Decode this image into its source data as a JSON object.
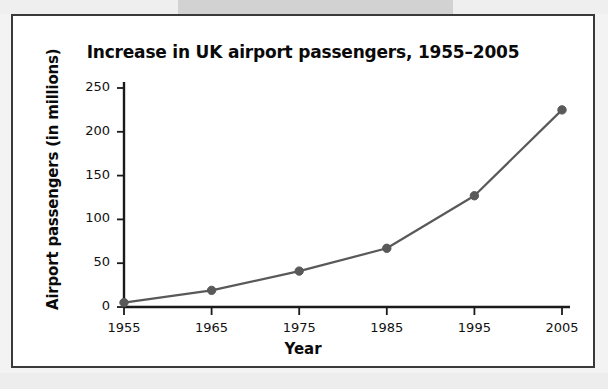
{
  "figure": {
    "frame_border_color": "#3a3a3a",
    "background_color": "#ffffff"
  },
  "chart_data": {
    "type": "line",
    "title": "Increase in UK airport passengers, 1955–2005",
    "xlabel": "Year",
    "ylabel": "Airport passengers (in millions)",
    "categories": [
      "1955",
      "1965",
      "1975",
      "1985",
      "1995",
      "2005"
    ],
    "x": [
      1955,
      1965,
      1975,
      1985,
      1995,
      2005
    ],
    "values": [
      5,
      19,
      41,
      67,
      127,
      225
    ],
    "series": [
      {
        "name": "UK airport passengers",
        "values": [
          5,
          19,
          41,
          67,
          127,
          225
        ]
      }
    ],
    "xlim": [
      1955,
      2005
    ],
    "ylim": [
      0,
      250
    ],
    "ytick_labels": [
      "0",
      "50",
      "100",
      "150",
      "200",
      "250"
    ],
    "yticks": [
      0,
      50,
      100,
      150,
      200,
      250
    ],
    "xtick_labels": [
      "1955",
      "1965",
      "1975",
      "1985",
      "1995",
      "2005"
    ],
    "xticks": [
      1955,
      1965,
      1975,
      1985,
      1995,
      2005
    ],
    "grid": false,
    "legend": null,
    "line_color": "#595959",
    "marker_color": "#595959",
    "marker_shape": "circle",
    "axis_color": "#1a1a1a"
  }
}
